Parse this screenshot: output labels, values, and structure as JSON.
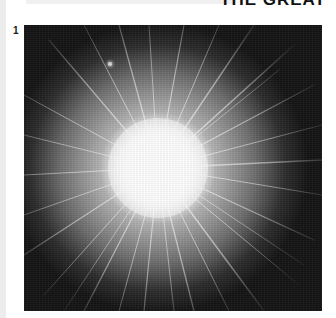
{
  "header": {
    "title_fragment": "THE GREAT"
  },
  "figure": {
    "number": "1",
    "image_subject": "starburst-explosion",
    "colors": {
      "background": "#141414",
      "core": "#ffffff",
      "rays": "#e6e6e6"
    }
  }
}
